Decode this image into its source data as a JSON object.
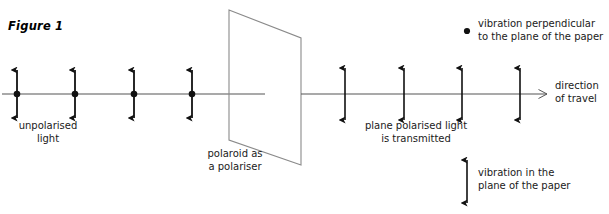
{
  "figure": {
    "caption": "Figure 1"
  },
  "labels": {
    "unpolarised_light": "unpolarised\nlight",
    "polaroid": "polaroid as\na polariser",
    "plane_polarised": "plane polarised light\nis transmitted",
    "direction_of_travel": "direction\nof travel",
    "key_perpendicular": "vibration perpendicular\nto the plane of the paper",
    "key_in_plane": "vibration in the\nplane of the paper"
  },
  "colors": {
    "stroke": "#1a1a1a",
    "ray_line": "#555555",
    "polaroid_outline": "#8a8a8a",
    "background": "#ffffff",
    "text": "#1a1a1a"
  },
  "diagram_data": {
    "type": "physics-optics-diagram",
    "ray_axis_y": 94,
    "incoming_ray": {
      "x_start": 2,
      "x_end": 265,
      "marker_kind": "dot-with-double-arrow",
      "marker_positions_x": [
        17,
        75,
        134,
        192
      ],
      "arrow_half_length": 28,
      "description": "unpolarised light: vibrations in all planes"
    },
    "polaroid": {
      "shape": "parallelogram",
      "corners": [
        [
          229,
          10
        ],
        [
          301,
          38
        ],
        [
          301,
          165
        ],
        [
          229,
          140
        ]
      ],
      "role": "polariser"
    },
    "outgoing_ray": {
      "x_start": 301,
      "x_end": 547,
      "marker_kind": "double-arrow",
      "marker_positions_x": [
        345,
        404,
        462,
        520
      ],
      "arrow_half_length": 28,
      "arrowhead_at_end": true,
      "description": "plane polarised light: vibrations only in the plane of the paper"
    },
    "key": [
      {
        "symbol": "dot",
        "x": 467,
        "y": 31,
        "meaning": "vibration perpendicular to the plane of the paper"
      },
      {
        "symbol": "double-arrow",
        "x": 467,
        "y_top": 160,
        "y_bottom": 203,
        "meaning": "vibration in the plane of the paper"
      }
    ]
  }
}
